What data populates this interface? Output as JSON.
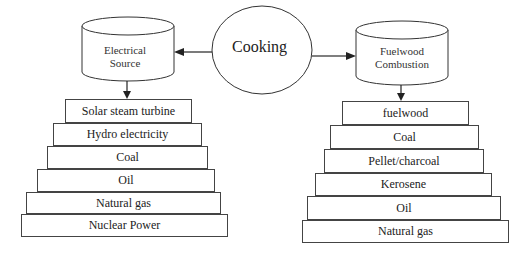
{
  "center": {
    "label": "Cooking"
  },
  "left": {
    "source_label_line1": "Electrical",
    "source_label_line2": "Source",
    "items": [
      {
        "label": "Solar steam turbine",
        "x": 65,
        "y": 99,
        "w": 127,
        "h": 24
      },
      {
        "label": "Hydro electricity",
        "x": 53,
        "y": 123,
        "w": 149,
        "h": 23
      },
      {
        "label": "Coal",
        "x": 47,
        "y": 146,
        "w": 161,
        "h": 23
      },
      {
        "label": "Oil",
        "x": 37,
        "y": 169,
        "w": 178,
        "h": 23
      },
      {
        "label": "Natural gas",
        "x": 26,
        "y": 192,
        "w": 195,
        "h": 22
      },
      {
        "label": "Nuclear Power",
        "x": 21,
        "y": 214,
        "w": 207,
        "h": 23
      }
    ]
  },
  "right": {
    "source_label_line1": "Fuelwood",
    "source_label_line2": "Combustion",
    "items": [
      {
        "label": "fuelwood",
        "x": 342,
        "y": 101,
        "w": 127,
        "h": 24
      },
      {
        "label": "Coal",
        "x": 330,
        "y": 125,
        "w": 149,
        "h": 24
      },
      {
        "label": "Pellet/charcoal",
        "x": 324,
        "y": 149,
        "w": 160,
        "h": 24
      },
      {
        "label": "Kerosene",
        "x": 315,
        "y": 173,
        "w": 177,
        "h": 23
      },
      {
        "label": "Oil",
        "x": 307,
        "y": 196,
        "w": 194,
        "h": 24
      },
      {
        "label": "Natural gas",
        "x": 302,
        "y": 220,
        "w": 207,
        "h": 23
      }
    ]
  }
}
